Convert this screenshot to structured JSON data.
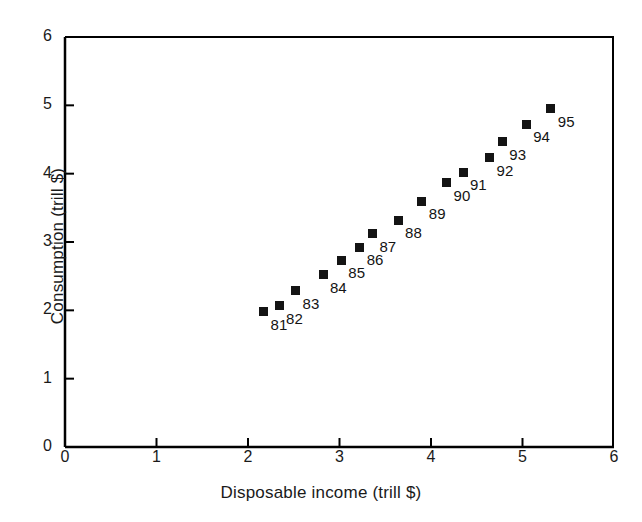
{
  "chart_data": {
    "type": "scatter",
    "title": "",
    "xlabel": "Disposable income (trill $)",
    "ylabel": "Consumption (trill $)",
    "xlim": [
      0,
      6
    ],
    "ylim": [
      0,
      6
    ],
    "xticks": [
      "0",
      "1",
      "2",
      "3",
      "4",
      "5",
      "6"
    ],
    "yticks": [
      "0",
      "1",
      "2",
      "3",
      "4",
      "5",
      "6"
    ],
    "grid": false,
    "legend": "none",
    "marker_color": "#141414",
    "marker_shape": "square",
    "axis_color": "#000000",
    "background": "#ffffff",
    "point_label_position": "lower-right",
    "points": [
      {
        "label": "81",
        "x": 2.17,
        "y": 1.98
      },
      {
        "label": "82",
        "x": 2.34,
        "y": 2.07
      },
      {
        "label": "83",
        "x": 2.52,
        "y": 2.29
      },
      {
        "label": "84",
        "x": 2.82,
        "y": 2.52
      },
      {
        "label": "85",
        "x": 3.02,
        "y": 2.73
      },
      {
        "label": "86",
        "x": 3.22,
        "y": 2.92
      },
      {
        "label": "87",
        "x": 3.36,
        "y": 3.12
      },
      {
        "label": "88",
        "x": 3.64,
        "y": 3.32
      },
      {
        "label": "89",
        "x": 3.9,
        "y": 3.6
      },
      {
        "label": "90",
        "x": 4.17,
        "y": 3.87
      },
      {
        "label": "91",
        "x": 4.35,
        "y": 4.02
      },
      {
        "label": "92",
        "x": 4.64,
        "y": 4.23
      },
      {
        "label": "93",
        "x": 4.78,
        "y": 4.47
      },
      {
        "label": "94",
        "x": 5.04,
        "y": 4.72
      },
      {
        "label": "95",
        "x": 5.31,
        "y": 4.95
      }
    ]
  },
  "axis": {
    "x_title": "Disposable income (trill $)",
    "y_title": "Consumption (trill $)"
  }
}
